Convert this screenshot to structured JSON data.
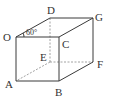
{
  "figure": {
    "type": "cuboid",
    "vertices": [
      "O",
      "A",
      "B",
      "C",
      "D",
      "E",
      "F",
      "G"
    ],
    "labels": {
      "O": "O",
      "A": "A",
      "B": "B",
      "C": "C",
      "D": "D",
      "E": "E",
      "F": "F",
      "G": "G"
    },
    "visible_edges": [
      [
        "O",
        "C"
      ],
      [
        "O",
        "A"
      ],
      [
        "A",
        "B"
      ],
      [
        "B",
        "C"
      ],
      [
        "O",
        "D"
      ],
      [
        "D",
        "G"
      ],
      [
        "C",
        "G"
      ],
      [
        "G",
        "F"
      ],
      [
        "B",
        "F"
      ]
    ],
    "hidden_edges": [
      [
        "D",
        "E"
      ],
      [
        "E",
        "A"
      ],
      [
        "E",
        "F"
      ]
    ],
    "angle": {
      "at": "O",
      "between": [
        "C",
        "D"
      ],
      "label": "60°"
    }
  }
}
